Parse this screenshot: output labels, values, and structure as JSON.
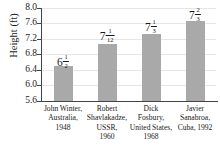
{
  "chart_data": {
    "type": "bar",
    "title": "",
    "xlabel": "",
    "ylabel": "Height (ft)",
    "ylim": [
      5.6,
      8.0
    ],
    "ytick_labels": [
      "8.0",
      "7.6",
      "7.2",
      "6.8",
      "6.4",
      "6.0",
      "5.6"
    ],
    "ytick_values": [
      8.0,
      7.6,
      7.2,
      6.8,
      6.4,
      6.0,
      5.6
    ],
    "grid": true,
    "legend": "none",
    "categories": [
      "John Winter, Australia, 1948",
      "Robert Shavlakadze, USSR, 1960",
      "Dick Fosbury, United States, 1968",
      "Javier Sanabroa, Cuba, 1992"
    ],
    "category_lines": [
      [
        "John Winter,",
        "Australia,",
        "1948"
      ],
      [
        "Robert",
        "Shavlakadze,",
        "USSR,",
        "1960"
      ],
      [
        "Dick",
        "Fosbury,",
        "United States,",
        "1968"
      ],
      [
        "Javier",
        "Sanabroa,",
        "Cuba, 1992"
      ]
    ],
    "values": [
      6.5,
      7.0833,
      7.3333,
      7.6667
    ],
    "value_labels": [
      {
        "whole": "6",
        "num": "1",
        "den": "2"
      },
      {
        "whole": "7",
        "num": "1",
        "den": "12"
      },
      {
        "whole": "7",
        "num": "1",
        "den": "3"
      },
      {
        "whole": "7",
        "num": "2",
        "den": "3"
      }
    ],
    "bar_color": "#a9a9a9",
    "grid_color": "#e6e6e6",
    "axis_color": "#444444"
  }
}
